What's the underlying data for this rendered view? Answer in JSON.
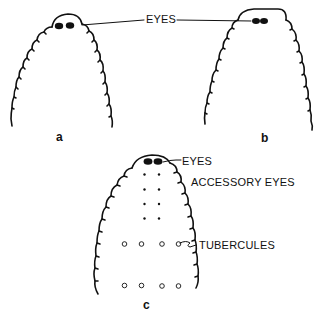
{
  "figure": {
    "panels": [
      {
        "id": "a",
        "label": "a",
        "eye_arrangement": "two eyes, close together near top-left of head"
      },
      {
        "id": "b",
        "label": "b",
        "eye_arrangement": "two eyes fused / touching near top-right of head"
      },
      {
        "id": "c",
        "label": "c",
        "eye_arrangement": "two eyes at top with accessory eyes and tubercules below"
      }
    ],
    "labels": {
      "eyes_shared": "EYES",
      "eyes_c": "EYES",
      "accessory_eyes": "ACCESSORY EYES",
      "tubercules": "TUBERCULES"
    },
    "panel_c_details": {
      "accessory_eye_rows": 4,
      "accessory_eye_columns": 2,
      "tubercule_rows": 2,
      "tubercules_per_row": 4
    },
    "colors": {
      "ink": "#111111",
      "background": "#ffffff"
    }
  }
}
